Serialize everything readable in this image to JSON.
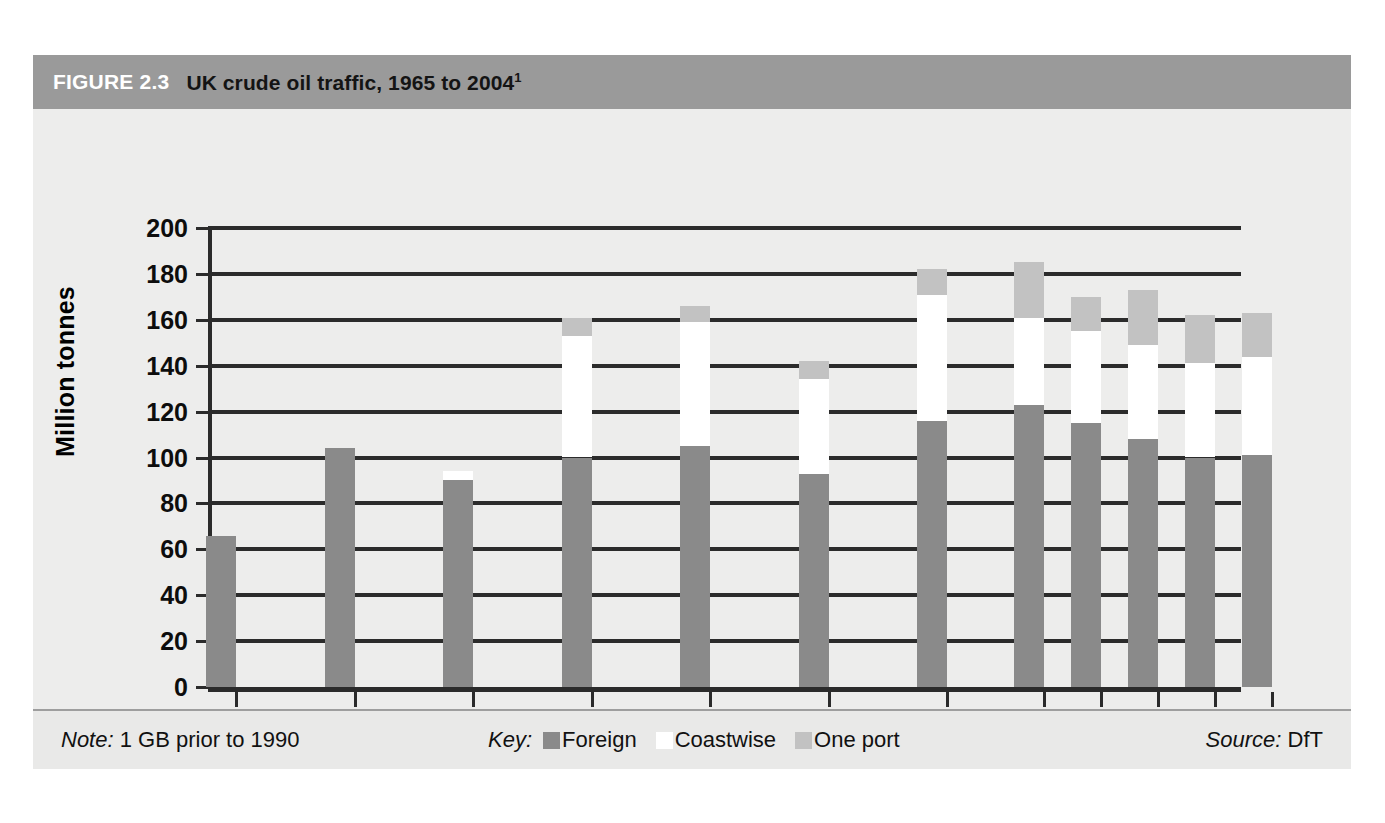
{
  "figure": {
    "number": "FIGURE 2.3",
    "title": "UK crude oil traffic, 1965 to 2004",
    "title_superscript": "1"
  },
  "footer": {
    "note_label": "Note:",
    "note_text": "1 GB prior to 1990",
    "key_label": "Key:",
    "source_label": "Source:",
    "source_text": "DfT"
  },
  "colors": {
    "foreign": "#8a8a8a",
    "coastwise": "#ffffff",
    "one_port": "#c2c2c2",
    "header_band": "#9a9a9a",
    "panel": "#ededec",
    "axis": "#2b2b2b"
  },
  "chart_data": {
    "type": "bar",
    "stacked": true,
    "title": "UK crude oil traffic, 1965 to 2004",
    "xlabel": "",
    "ylabel": "Million tonnes",
    "ylim": [
      0,
      200
    ],
    "ytick_step": 20,
    "yticks": [
      0,
      20,
      40,
      60,
      80,
      100,
      120,
      140,
      160,
      180,
      200
    ],
    "grid": true,
    "legend_position": "bottom-center",
    "units": "Million tonnes",
    "categories": [
      "1965",
      "1970",
      "1975",
      "1980",
      "1985",
      "1990",
      "1995",
      "2000",
      "2001",
      "2002",
      "2003",
      "2004"
    ],
    "series": [
      {
        "name": "Foreign",
        "color": "#8a8a8a",
        "values": [
          66,
          104,
          90,
          100,
          105,
          93,
          116,
          123,
          115,
          108,
          100,
          101
        ]
      },
      {
        "name": "Coastwise",
        "color": "#ffffff",
        "values": [
          0,
          0,
          4,
          53,
          54,
          41,
          55,
          38,
          40,
          41,
          41,
          43
        ]
      },
      {
        "name": "One port",
        "color": "#c2c2c2",
        "values": [
          0,
          0,
          0,
          8,
          7,
          8,
          11,
          24,
          15,
          24,
          21,
          19
        ]
      }
    ],
    "totals": [
      66,
      104,
      94,
      161,
      166,
      142,
      182,
      185,
      170,
      173,
      162,
      163
    ]
  }
}
